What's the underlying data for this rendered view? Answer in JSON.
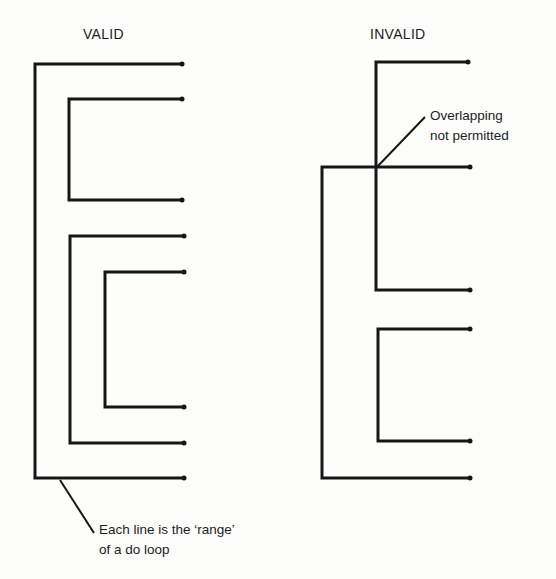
{
  "diagram": {
    "type": "do-loop nesting illustration",
    "valid_panel": {
      "heading": "VALID",
      "loops": [
        {
          "name": "outer-loop",
          "x": 35,
          "y_start": 64,
          "y_end": 478,
          "x_end_top": 182,
          "x_end_bottom": 184
        },
        {
          "name": "inner-loop-1",
          "x": 69,
          "y_start": 99,
          "y_end": 200,
          "x_end_top": 182,
          "x_end_bottom": 182
        },
        {
          "name": "inner-loop-2",
          "x": 70,
          "y_start": 236,
          "y_end": 443,
          "x_end_top": 184,
          "x_end_bottom": 184
        },
        {
          "name": "inner-loop-2a",
          "x": 105,
          "y_start": 272,
          "y_end": 407,
          "x_end_top": 184,
          "x_end_bottom": 184
        }
      ],
      "annotation": {
        "line1": "Each line is the ‘range’",
        "line2": "of a do loop"
      }
    },
    "invalid_panel": {
      "heading": "INVALID",
      "loops": [
        {
          "name": "loop-a",
          "x": 376,
          "y_start": 62,
          "y_end": 290,
          "x_end_top": 468,
          "x_end_bottom": 470
        },
        {
          "name": "loop-b",
          "x": 322,
          "y_start": 167,
          "y_end": 478,
          "x_end_top": 470,
          "x_end_bottom": 470
        },
        {
          "name": "loop-c",
          "x": 378,
          "y_start": 329,
          "y_end": 441,
          "x_end_top": 470,
          "x_end_bottom": 470
        }
      ],
      "annotation": {
        "line1": "Overlapping",
        "line2": "not permitted"
      }
    },
    "colors": {
      "ink": "#161616",
      "paper": "#fdfdfb"
    }
  }
}
